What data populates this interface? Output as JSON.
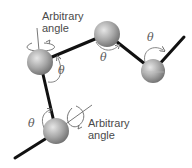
{
  "diagram": {
    "labels": {
      "arbitrary_top_line1": "Arbitrary",
      "arbitrary_top_line2": "angle",
      "arbitrary_bottom_line1": "Arbitrary",
      "arbitrary_bottom_line2": "angle",
      "theta_1": "θ",
      "theta_2": "θ",
      "theta_3": "θ",
      "theta_4": "θ"
    },
    "colors": {
      "bond": "#111111",
      "axis": "#555555",
      "arrow": "#777777",
      "sphere_light": "#d8d8d8",
      "sphere_dark": "#7a7a7a"
    },
    "atoms": [
      {
        "id": "atom-upper-left",
        "cx": 40,
        "cy": 62,
        "r": 13
      },
      {
        "id": "atom-top",
        "cx": 107,
        "cy": 34,
        "r": 13
      },
      {
        "id": "atom-right",
        "cx": 153,
        "cy": 71,
        "r": 12
      },
      {
        "id": "atom-lower-left",
        "cx": 56,
        "cy": 131,
        "r": 13
      }
    ]
  }
}
